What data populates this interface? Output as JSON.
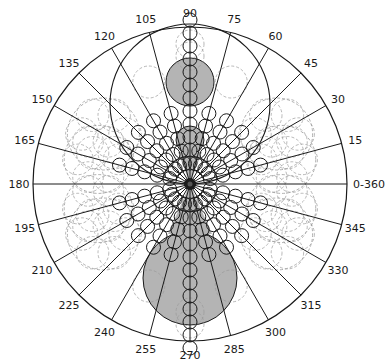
{
  "diagram": {
    "type": "polar-rose",
    "center": [
      190,
      184
    ],
    "radius": 157,
    "colors": {
      "line": "#1a1a1a",
      "dashed": "#9a9a9a",
      "shade": "#b4b4b4",
      "background": "#ffffff"
    },
    "angle_labels": [
      {
        "angle": 0,
        "text": "0-360"
      },
      {
        "angle": 15,
        "text": "15"
      },
      {
        "angle": 30,
        "text": "30"
      },
      {
        "angle": 45,
        "text": "45"
      },
      {
        "angle": 60,
        "text": "60"
      },
      {
        "angle": 75,
        "text": "75"
      },
      {
        "angle": 90,
        "text": "90"
      },
      {
        "angle": 105,
        "text": "105"
      },
      {
        "angle": 120,
        "text": "120"
      },
      {
        "angle": 135,
        "text": "135"
      },
      {
        "angle": 150,
        "text": "150"
      },
      {
        "angle": 165,
        "text": "165"
      },
      {
        "angle": 180,
        "text": "180"
      },
      {
        "angle": 195,
        "text": "195"
      },
      {
        "angle": 210,
        "text": "210"
      },
      {
        "angle": 225,
        "text": "225"
      },
      {
        "angle": 240,
        "text": "240"
      },
      {
        "angle": 255,
        "text": "255"
      },
      {
        "angle": 270,
        "text": "270"
      },
      {
        "angle": 285,
        "text": "285"
      },
      {
        "angle": 300,
        "text": "300"
      },
      {
        "angle": 315,
        "text": "315"
      },
      {
        "angle": 330,
        "text": "330"
      },
      {
        "angle": 345,
        "text": "345"
      }
    ],
    "shaded_circles": [
      {
        "cx": 190,
        "cy": 82,
        "r": 24
      },
      {
        "cx": 190,
        "cy": 140,
        "r": 14
      },
      {
        "cx": 190,
        "cy": 278,
        "r": 47
      }
    ],
    "outline_circles": [
      {
        "cx": 190,
        "cy": 104,
        "r": 80
      }
    ],
    "chain_circle_radius": 7,
    "chain_spacing": 13,
    "chain_counts": {
      "vertical": 12,
      "diagonal": 5
    },
    "dashed_rings": [
      {
        "angle": 15,
        "dist": 95,
        "r": 34
      },
      {
        "angle": 30,
        "dist": 100,
        "r": 36
      },
      {
        "angle": 165,
        "dist": 95,
        "r": 34
      },
      {
        "angle": 150,
        "dist": 100,
        "r": 36
      },
      {
        "angle": 195,
        "dist": 95,
        "r": 34
      },
      {
        "angle": 210,
        "dist": 100,
        "r": 36
      },
      {
        "angle": 345,
        "dist": 95,
        "r": 34
      },
      {
        "angle": 330,
        "dist": 100,
        "r": 36
      }
    ]
  }
}
